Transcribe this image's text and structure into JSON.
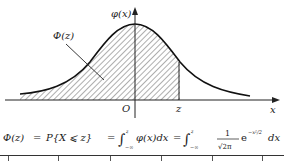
{
  "figure": {
    "y_axis_label": "φ(x)",
    "x_axis_label": "x",
    "origin_label": "O",
    "z_label": "z",
    "area_label": "Φ(z)",
    "curve": "standard normal density φ(x)",
    "shaded_region": "x ≤ z"
  },
  "formula": {
    "lhs": "Φ(z)",
    "eq1": "=",
    "prob": "P{X ⩽ z}",
    "eq2": "=",
    "integral1": "∫",
    "upper1": "z",
    "lower1": "−∞",
    "integrand1": "φ(x)dx",
    "eq3": "=",
    "integral2": "∫",
    "upper2": "z",
    "lower2": "−∞",
    "frac_num": "1",
    "frac_den": "√2π",
    "exp_base": "e",
    "exp_power": "−x²/2",
    "dx": "dx"
  },
  "colors": {
    "ink": "#1a1a1a",
    "background": "#ffffff"
  }
}
